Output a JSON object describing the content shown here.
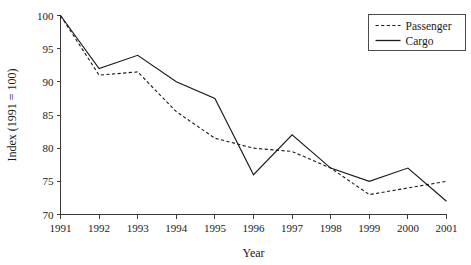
{
  "chart_data": {
    "type": "line",
    "title": "",
    "xlabel": "Year",
    "ylabel": "Index (1991 = 100)",
    "x": [
      1991,
      1992,
      1993,
      1994,
      1995,
      1996,
      1997,
      1998,
      1999,
      2000,
      2001
    ],
    "xtick_labels": [
      "1991",
      "1992",
      "1993",
      "1994",
      "1995",
      "1996",
      "1997",
      "1998",
      "1999",
      "2000",
      "2001"
    ],
    "ytick_labels": [
      "70",
      "75",
      "80",
      "85",
      "90",
      "95",
      "100"
    ],
    "yticks": [
      70,
      75,
      80,
      85,
      90,
      95,
      100
    ],
    "ylim": [
      70,
      100
    ],
    "xlim": [
      1991,
      2001
    ],
    "grid": false,
    "legend_position": "top-right",
    "series": [
      {
        "name": "Passenger",
        "style": "dashed",
        "color": "#1a1a1a",
        "values": [
          100,
          91,
          91.5,
          85.5,
          81.5,
          80,
          79.5,
          77,
          73,
          74,
          75
        ]
      },
      {
        "name": "Cargo",
        "style": "solid",
        "color": "#1a1a1a",
        "values": [
          100,
          92,
          94,
          90,
          87.5,
          76,
          82,
          77,
          75,
          77,
          72
        ]
      }
    ]
  },
  "legend": {
    "entries": [
      {
        "label": "Passenger",
        "style": "dashed"
      },
      {
        "label": "Cargo",
        "style": "solid"
      }
    ]
  }
}
